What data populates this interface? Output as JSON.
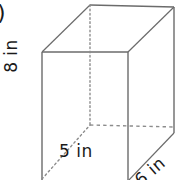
{
  "figure": {
    "kind": "rectangular-prism-diagram",
    "problem_marker": ")",
    "line_color": "#6b6b6b",
    "hidden_line_color": "#8c8c8c",
    "text_color": "#1a1a1a",
    "background": "#ffffff"
  },
  "labels": {
    "height": "8 in",
    "width": "5 in",
    "depth": "6 in"
  },
  "geometry": {
    "front_face": {
      "top_left": [
        42,
        52
      ],
      "top_right": [
        128,
        52
      ],
      "bottom_right": [
        128,
        180
      ],
      "bottom_left": [
        42,
        180
      ]
    },
    "back_face": {
      "top_left": [
        90,
        5
      ],
      "top_right": [
        174,
        7
      ],
      "bottom_right": [
        174,
        133
      ],
      "bottom_left": [
        90,
        125
      ]
    },
    "hidden_edges": [
      "back-top-left to back-bottom-left",
      "back-bottom-left to back-bottom-right",
      "back-bottom-left to front-bottom-left"
    ]
  }
}
